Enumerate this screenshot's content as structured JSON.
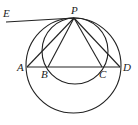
{
  "diagram": {
    "type": "geometry",
    "points": {
      "P": {
        "label": "P",
        "x": 74,
        "y": 18
      },
      "A": {
        "label": "A",
        "x": 27,
        "y": 67
      },
      "B": {
        "label": "B",
        "x": 48,
        "y": 67
      },
      "C": {
        "label": "C",
        "x": 102,
        "y": 67
      },
      "D": {
        "label": "D",
        "x": 120,
        "y": 67
      },
      "E": {
        "label": "E",
        "x": 6,
        "y": 22
      }
    },
    "circles": [
      {
        "name": "large-circle",
        "cx": 73.5,
        "cy": 65.5,
        "r": 47.5
      },
      {
        "name": "small-circle",
        "cx": 75,
        "cy": 51,
        "r": 33
      }
    ],
    "segments": [
      [
        "E",
        "P"
      ],
      [
        "A",
        "D"
      ],
      [
        "P",
        "A"
      ],
      [
        "P",
        "B"
      ],
      [
        "P",
        "C"
      ],
      [
        "P",
        "D"
      ]
    ],
    "label_positions": {
      "P": {
        "x": 71,
        "y": 14
      },
      "E": {
        "x": 3,
        "y": 16
      },
      "A": {
        "x": 17,
        "y": 71
      },
      "B": {
        "x": 41,
        "y": 78
      },
      "C": {
        "x": 99,
        "y": 78
      },
      "D": {
        "x": 123,
        "y": 71
      }
    }
  }
}
